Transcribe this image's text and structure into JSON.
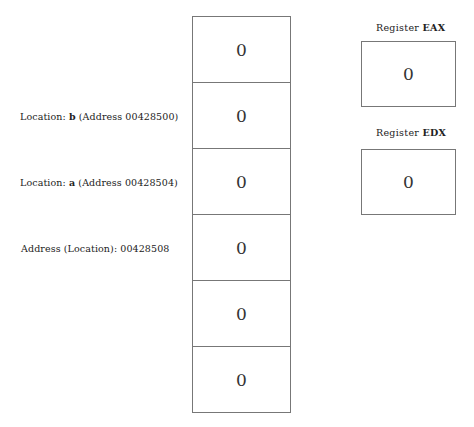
{
  "memory": {
    "cells": [
      {
        "value": "0"
      },
      {
        "value": "0"
      },
      {
        "value": "0"
      },
      {
        "value": "0"
      },
      {
        "value": "0"
      },
      {
        "value": "0"
      }
    ]
  },
  "labels": {
    "b": {
      "prefix": "Location: ",
      "name": "b",
      "suffix": " (Address 00428500)"
    },
    "a": {
      "prefix": "Location: ",
      "name": "a",
      "suffix": " (Address 00428504)"
    },
    "addr": {
      "text": "Address (Location): 00428508"
    }
  },
  "registers": {
    "eax": {
      "prefix": "Register ",
      "name": "EAX",
      "value": "0"
    },
    "edx": {
      "prefix": "Register ",
      "name": "EDX",
      "value": "0"
    }
  }
}
